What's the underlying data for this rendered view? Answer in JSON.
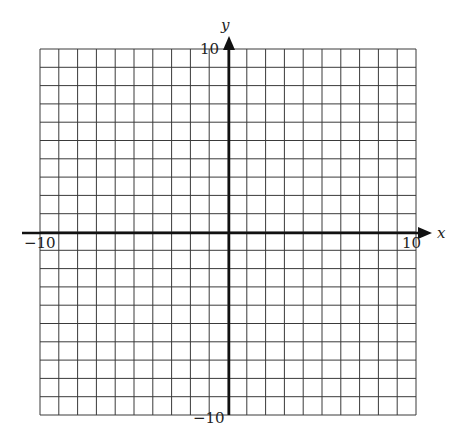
{
  "chart_data": {
    "type": "scatter",
    "title": "",
    "xlabel": "x",
    "ylabel": "y",
    "xlim": [
      -10,
      10
    ],
    "ylim": [
      -10,
      10
    ],
    "grid": true,
    "grid_step": 1,
    "x_tick_labels": [
      "-10",
      "10"
    ],
    "y_tick_labels": [
      "10",
      "-10"
    ],
    "points": [],
    "legend": null
  },
  "labels": {
    "x_axis_name": "x",
    "y_axis_name": "y",
    "x_min": "−10",
    "x_max": "10",
    "y_max": "10",
    "y_min": "−10"
  },
  "colors": {
    "grid": "#3a3a3a",
    "axis": "#111111",
    "background": "#ffffff"
  }
}
